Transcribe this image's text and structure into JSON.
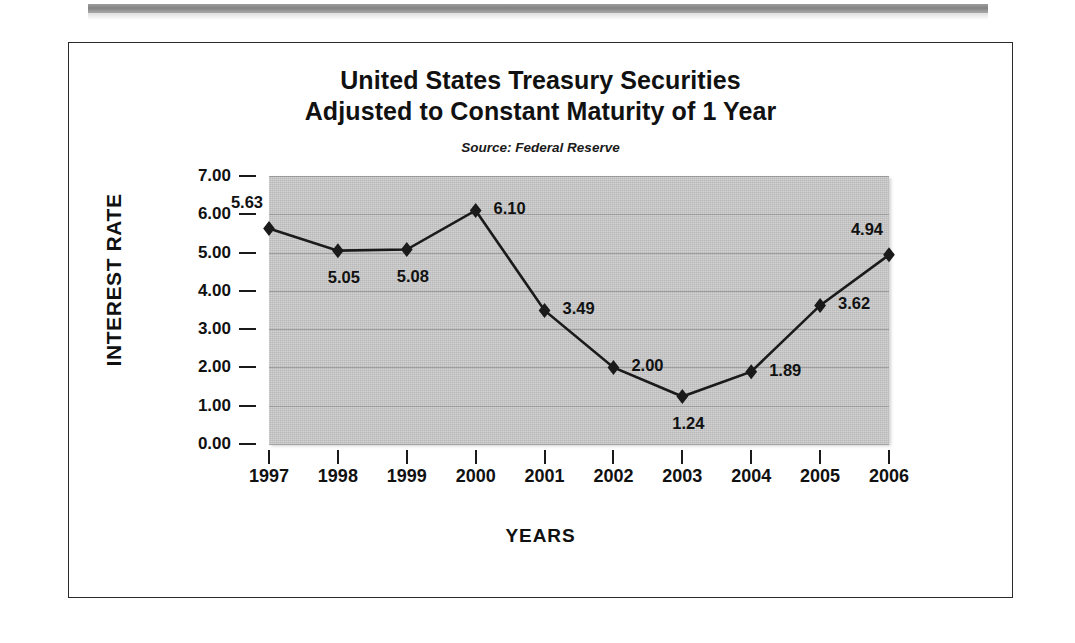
{
  "figure": {
    "title_line1": "United States Treasury Securities",
    "title_line2": "Adjusted to Constant Maturity of 1 Year",
    "source_note": "Source:  Federal Reserve",
    "frame_color": "#2b2b2b",
    "plot_background": "#b9b9b9",
    "series_color": "#1a1a1a"
  },
  "chart_data": {
    "type": "line",
    "title": "United States Treasury Securities Adjusted to Constant Maturity of 1 Year",
    "subtitle": "Source:  Federal Reserve",
    "xlabel": "YEARS",
    "ylabel": "INTEREST RATE",
    "categories": [
      "1997",
      "1998",
      "1999",
      "2000",
      "2001",
      "2002",
      "2003",
      "2004",
      "2005",
      "2006"
    ],
    "values": [
      5.63,
      5.05,
      5.08,
      6.1,
      3.49,
      2.0,
      1.24,
      1.89,
      3.62,
      4.94
    ],
    "point_labels": [
      "5.63",
      "5.05",
      "5.08",
      "6.10",
      "3.49",
      "2.00",
      "1.24",
      "1.89",
      "3.62",
      "4.94"
    ],
    "label_positions": [
      "above-left",
      "below",
      "below",
      "right",
      "right",
      "right",
      "below",
      "right",
      "right",
      "above-left"
    ],
    "ylim": [
      0,
      7
    ],
    "ytick_values": [
      0,
      1,
      2,
      3,
      4,
      5,
      6,
      7
    ],
    "ytick_labels": [
      "0.00",
      "1.00",
      "2.00",
      "3.00",
      "4.00",
      "5.00",
      "6.00",
      "7.00"
    ],
    "grid": true,
    "grid_axis": "y",
    "legend": false,
    "marker": "diamond"
  }
}
